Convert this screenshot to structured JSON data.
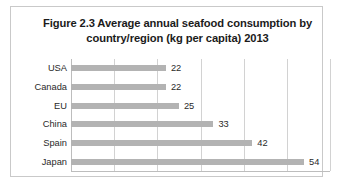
{
  "figure": {
    "title_line1": "Figure 2.3 Average annual seafood consumption by",
    "title_line2": "country/region (kg per capita) 2013"
  },
  "chart_data": {
    "type": "bar",
    "orientation": "horizontal",
    "title": "Figure 2.3 Average annual seafood consumption by country/region (kg per capita) 2013",
    "xlabel": "",
    "ylabel": "",
    "unit": "kg per capita",
    "year": 2013,
    "categories": [
      "USA",
      "Canada",
      "EU",
      "China",
      "Spain",
      "Japan"
    ],
    "values": [
      22,
      22,
      25,
      33,
      42,
      54
    ],
    "value_labels": [
      "22",
      "22",
      "25",
      "33",
      "42",
      "54"
    ],
    "xlim": [
      0,
      60
    ],
    "gridline_values": [
      0,
      10,
      20,
      30,
      40,
      50,
      60
    ],
    "grid": true,
    "legend": false,
    "x_tick_labels_shown": false,
    "bar_color": "#b3b3b3",
    "grid_color": "#d2d2d2",
    "axis_color": "#bdbdbd",
    "text_color": "#2a2a2a",
    "frame_color": "#c9c9c9",
    "background": "#ffffff"
  }
}
